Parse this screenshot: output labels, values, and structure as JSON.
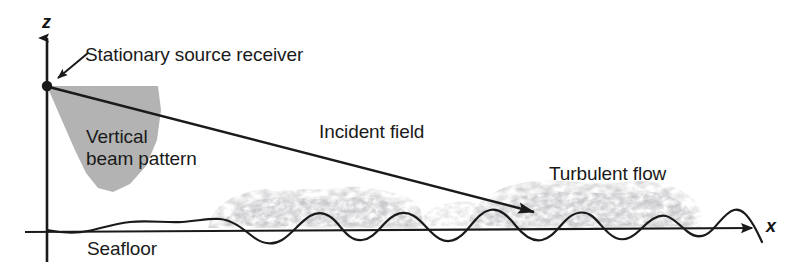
{
  "figure": {
    "type": "schematic-diagram",
    "background_color": "#ffffff",
    "line_color": "#1a1a1a",
    "beam_fill_color": "#b3b3b3",
    "turbulence_cloud_color": "#9a9a9a"
  },
  "axes": {
    "vertical": {
      "label": "z",
      "name": "z-axis",
      "direction": "up",
      "origin_px": [
        47,
        228
      ],
      "tip_px": [
        47,
        32
      ]
    },
    "horizontal": {
      "label": "x",
      "name": "x-axis",
      "direction": "right",
      "start_px": [
        25,
        232
      ],
      "tip_px": [
        760,
        228
      ]
    }
  },
  "source": {
    "label": "Stationary source receiver",
    "marker": "filled-dot",
    "position_px": [
      47,
      85
    ],
    "leader_from_px": [
      88,
      54
    ],
    "leader_to_px": [
      55,
      80
    ]
  },
  "beam": {
    "label_line_1": "Vertical",
    "label_line_2": "beam pattern",
    "label": "Vertical beam pattern",
    "fill": "#b3b3b3"
  },
  "incident": {
    "label": "Incident field",
    "arrow_from_px": [
      48,
      86
    ],
    "arrow_to_px": [
      548,
      216
    ]
  },
  "turbulence": {
    "label": "Turbulent flow",
    "extent_px": [
      205,
      700
    ]
  },
  "seafloor": {
    "label": "Seafloor",
    "description": "rippled seabed interface"
  }
}
